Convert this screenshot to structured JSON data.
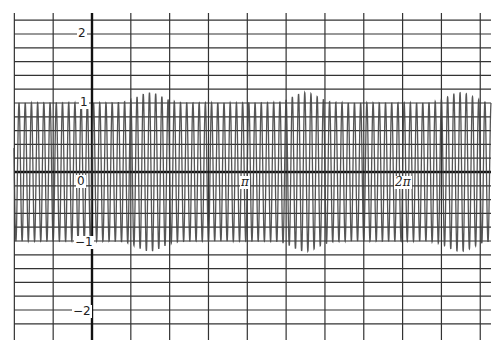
{
  "chart_data": {
    "type": "line",
    "title": "",
    "xlabel": "",
    "ylabel": "",
    "function_description": "Dense high-frequency oscillation of amplitude ~1 with periodic small envelope bumps (~1.15) every pi",
    "series": [
      {
        "name": "signal",
        "frequency": 50,
        "amplitude": 1,
        "envelope_bump": 0.15,
        "envelope_bump_centers": [
          1.17,
          4.31,
          7.45
        ],
        "color": "#444444"
      }
    ],
    "xlim": [
      -1.9,
      7.7
    ],
    "ylim": [
      -2.2,
      2.3
    ],
    "x_ticks": [
      {
        "value": 0,
        "label": "0"
      },
      {
        "value": 3.14159,
        "label": "π"
      },
      {
        "value": 6.28318,
        "label": "2π"
      }
    ],
    "y_ticks": [
      {
        "value": 2,
        "label": "2"
      },
      {
        "value": 1,
        "label": "1"
      },
      {
        "value": -1,
        "label": "−1"
      },
      {
        "value": -2,
        "label": "−2"
      }
    ],
    "grid": {
      "on": true,
      "x_step": 0.785398,
      "y_step": 0.2,
      "color": "#333333"
    },
    "legend": null
  },
  "labels": {
    "x_zero": "0",
    "x_pi": "π",
    "x_2pi": "2π",
    "y_2": "2",
    "y_1": "1",
    "y_neg1": "−1",
    "y_neg2": "−2"
  }
}
